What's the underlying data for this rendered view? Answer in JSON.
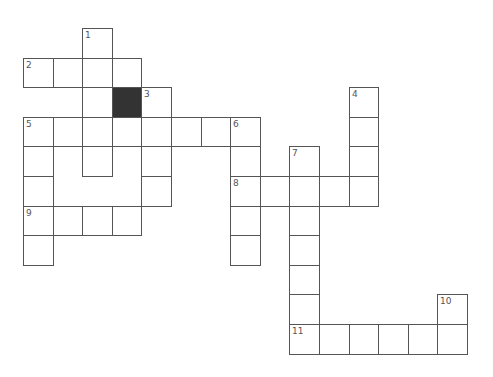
{
  "puzzle": {
    "type": "crossword",
    "cell_size": 29.6,
    "origin": {
      "x": 23,
      "y": 28
    },
    "colors": {
      "border": "#555555",
      "block": "#333333",
      "cell": "#ffffff",
      "number": "#555555"
    },
    "clues": [
      {
        "number": "1",
        "direction": "down",
        "col": 2,
        "row": 0,
        "length": 5
      },
      {
        "number": "2",
        "direction": "across",
        "col": 0,
        "row": 1,
        "length": 4
      },
      {
        "number": "3",
        "direction": "down",
        "col": 4,
        "row": 2,
        "length": 4
      },
      {
        "number": "4",
        "direction": "down",
        "col": 11,
        "row": 2,
        "length": 4
      },
      {
        "number": "5",
        "direction": "across",
        "col": 0,
        "row": 3,
        "length": 8
      },
      {
        "number": "5",
        "direction": "down",
        "col": 0,
        "row": 3,
        "length": 5
      },
      {
        "number": "6",
        "direction": "down",
        "col": 7,
        "row": 3,
        "length": 5
      },
      {
        "number": "7",
        "direction": "down",
        "col": 9,
        "row": 4,
        "length": 7
      },
      {
        "number": "8",
        "direction": "across",
        "col": 7,
        "row": 5,
        "length": 5
      },
      {
        "number": "9",
        "direction": "across",
        "col": 0,
        "row": 6,
        "length": 4
      },
      {
        "number": "10",
        "direction": "down",
        "col": 14,
        "row": 9,
        "length": 2
      },
      {
        "number": "11",
        "direction": "across",
        "col": 9,
        "row": 10,
        "length": 6
      }
    ],
    "blocks": [
      {
        "col": 3,
        "row": 2
      }
    ]
  }
}
